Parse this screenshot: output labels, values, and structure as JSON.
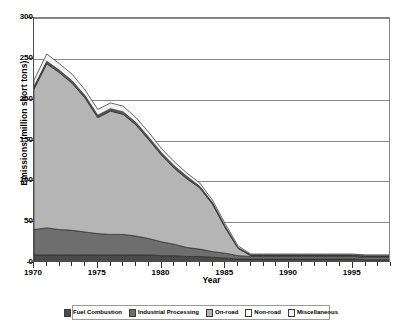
{
  "chart_data": {
    "type": "area",
    "stacked": true,
    "title": "",
    "xlabel": "Year",
    "ylabel": "Emissions (million short tons)",
    "xlim": [
      1970,
      1998
    ],
    "ylim": [
      0,
      300
    ],
    "ytick_labels": [
      "0",
      "50",
      "100",
      "150",
      "200",
      "250",
      "300"
    ],
    "ytick_values": [
      0,
      50,
      100,
      150,
      200,
      250,
      300
    ],
    "xtick_labels": [
      "1970",
      "1975",
      "1980",
      "1985",
      "1990",
      "1995"
    ],
    "xtick_values": [
      1970,
      1975,
      1980,
      1985,
      1990,
      1995
    ],
    "grid": "horizontal",
    "legend_position": "bottom",
    "x": [
      1970,
      1971,
      1972,
      1973,
      1974,
      1975,
      1976,
      1977,
      1978,
      1979,
      1980,
      1981,
      1982,
      1983,
      1984,
      1985,
      1986,
      1987,
      1988,
      1989,
      1990,
      1991,
      1992,
      1993,
      1994,
      1995,
      1996,
      1997,
      1998
    ],
    "series": [
      {
        "name": "Fuel Combustion",
        "color": "#4a4a4a",
        "values": [
          10,
          10,
          10,
          10,
          10,
          10,
          10,
          10,
          10,
          10,
          9,
          9,
          8,
          8,
          7,
          6,
          5,
          5,
          5,
          5,
          5,
          5,
          5,
          5,
          5,
          5,
          4,
          4,
          4
        ]
      },
      {
        "name": "Industrial Processing",
        "color": "#6e6e6e",
        "values": [
          31,
          33,
          31,
          30,
          28,
          26,
          25,
          25,
          23,
          20,
          17,
          14,
          11,
          9,
          7,
          6,
          4,
          3,
          3,
          3,
          3,
          3,
          3,
          3,
          3,
          3,
          3,
          3,
          3
        ]
      },
      {
        "name": "On-road",
        "color": "#b5b5b5",
        "values": [
          172,
          201,
          192,
          180,
          164,
          142,
          151,
          147,
          136,
          121,
          106,
          93,
          84,
          75,
          58,
          31,
          9,
          1,
          1,
          1,
          1,
          1,
          1,
          1,
          1,
          1,
          1,
          1,
          1
        ]
      },
      {
        "name": "Non-road",
        "color": "#5a5a5a",
        "values": [
          3,
          3,
          3,
          3,
          3,
          3,
          3,
          3,
          3,
          3,
          3,
          3,
          3,
          2,
          2,
          2,
          1,
          1,
          1,
          1,
          1,
          1,
          1,
          1,
          1,
          1,
          1,
          1,
          1
        ]
      },
      {
        "name": "Miscellaneous",
        "color": "#f2f2f2",
        "values": [
          8,
          9,
          8,
          8,
          7,
          7,
          7,
          7,
          6,
          6,
          5,
          5,
          4,
          4,
          3,
          3,
          2,
          1,
          1,
          1,
          1,
          1,
          1,
          1,
          1,
          1,
          1,
          1,
          1
        ]
      }
    ],
    "totals": [
      224,
      256,
      244,
      231,
      212,
      188,
      196,
      192,
      178,
      160,
      140,
      124,
      110,
      98,
      77,
      48,
      21,
      11,
      11,
      11,
      11,
      11,
      11,
      11,
      11,
      11,
      10,
      10,
      10
    ]
  },
  "legend": {
    "items": [
      {
        "label": "Fuel Combustion",
        "color": "#4a4a4a"
      },
      {
        "label": "Industrial Processing",
        "color": "#6e6e6e"
      },
      {
        "label": "On-road",
        "color": "#b5b5b5"
      },
      {
        "label": "Non-road",
        "color": "#fdfdfd"
      },
      {
        "label": "Miscellaneous",
        "color": "#f2f2f2"
      }
    ]
  }
}
